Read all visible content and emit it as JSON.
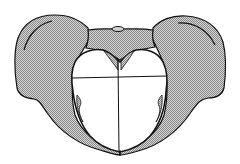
{
  "diagram": {
    "colors": {
      "background": "#ffffff",
      "bone_fill": "#b9b9b9",
      "bone_fill_light": "#d6d6d6",
      "outline": "#111111",
      "inlet_fill": "#ffffff"
    },
    "parts": [
      {
        "id": "left-iliac-wing"
      },
      {
        "id": "right-iliac-wing"
      },
      {
        "id": "sacrum"
      },
      {
        "id": "sacral-promontory"
      },
      {
        "id": "pelvic-inlet"
      },
      {
        "id": "transverse-diameter"
      },
      {
        "id": "anteroposterior-diameter"
      },
      {
        "id": "pubic-symphysis"
      }
    ],
    "labels": []
  }
}
